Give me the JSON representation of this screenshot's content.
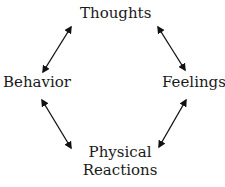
{
  "diagram": {
    "type": "cycle",
    "nodes": {
      "thoughts": "Thoughts",
      "behavior": "Behavior",
      "feelings": "Feelings",
      "physical_line1": "Physical",
      "physical_line2": "Reactions"
    },
    "edges": [
      {
        "from": "Behavior",
        "to": "Thoughts",
        "direction": "bidirectional"
      },
      {
        "from": "Thoughts",
        "to": "Feelings",
        "direction": "bidirectional"
      },
      {
        "from": "Behavior",
        "to": "Physical Reactions",
        "direction": "bidirectional"
      },
      {
        "from": "Feelings",
        "to": "Physical Reactions",
        "direction": "bidirectional"
      }
    ],
    "colors": {
      "text": "#1a1a1a",
      "arrow": "#111111",
      "background": "#ffffff"
    }
  }
}
